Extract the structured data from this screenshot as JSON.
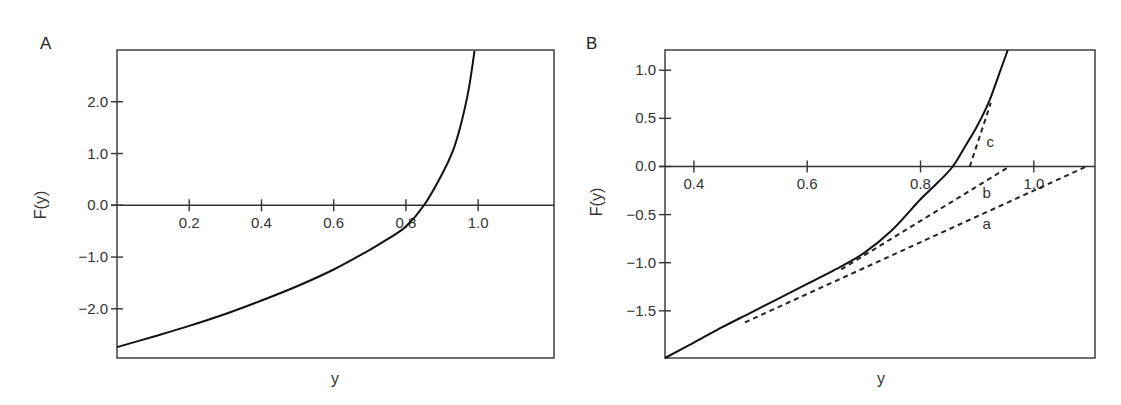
{
  "chart_data": [
    {
      "panel": "A",
      "type": "line",
      "title": "",
      "xlabel": "y",
      "ylabel": "F(y)",
      "xlim": [
        0.0,
        1.21
      ],
      "ylim": [
        -2.95,
        3.0
      ],
      "grid": false,
      "x_ticks": [
        0.2,
        0.4,
        0.6,
        0.8,
        1.0
      ],
      "x_tick_labels": [
        "0.2",
        "0.4",
        "0.6",
        "0.8",
        "1.0"
      ],
      "y_ticks": [
        2.0,
        1.0,
        0.0,
        -1.0,
        -2.0
      ],
      "y_tick_labels": [
        "2.0",
        "1.0",
        "0.0",
        "−1.0",
        "−2.0"
      ],
      "x_axis_at_y": 0.0,
      "series": [
        {
          "name": "F(y)",
          "style": "solid",
          "x": [
            0.0,
            0.1,
            0.2,
            0.3,
            0.4,
            0.5,
            0.6,
            0.7,
            0.75,
            0.8,
            0.85,
            0.9,
            0.93,
            0.95,
            0.97,
            0.98,
            0.99
          ],
          "y": [
            -2.74,
            -2.54,
            -2.33,
            -2.1,
            -1.84,
            -1.56,
            -1.24,
            -0.86,
            -0.65,
            -0.41,
            0.0,
            0.6,
            1.05,
            1.5,
            2.1,
            2.5,
            2.98
          ]
        }
      ]
    },
    {
      "panel": "B",
      "type": "line",
      "title": "",
      "xlabel": "y",
      "ylabel": "F(y)",
      "xlim": [
        0.349,
        1.108
      ],
      "ylim": [
        -1.99,
        1.21
      ],
      "grid": false,
      "x_ticks": [
        0.4,
        0.6,
        0.8,
        1.0
      ],
      "x_tick_labels": [
        "0.4",
        "0.6",
        "0.8",
        "1.0"
      ],
      "y_ticks": [
        1.0,
        0.5,
        0.0,
        -0.5,
        -1.0,
        -1.5
      ],
      "y_tick_labels": [
        "1.0",
        "0.5",
        "0.0",
        "−0.5",
        "−1.0",
        "−1.5"
      ],
      "x_axis_at_y": 0.0,
      "series": [
        {
          "name": "F(y)",
          "style": "solid",
          "x": [
            0.349,
            0.4,
            0.45,
            0.5,
            0.55,
            0.6,
            0.65,
            0.7,
            0.75,
            0.8,
            0.83,
            0.857,
            0.88,
            0.9,
            0.92,
            0.94,
            0.954
          ],
          "y": [
            -1.99,
            -1.83,
            -1.67,
            -1.52,
            -1.37,
            -1.22,
            -1.07,
            -0.9,
            -0.66,
            -0.34,
            -0.17,
            0.0,
            0.22,
            0.42,
            0.66,
            0.98,
            1.21
          ]
        },
        {
          "name": "a",
          "style": "dashed",
          "label_pos": {
            "x": 0.917,
            "y": -0.6
          },
          "x": [
            0.49,
            1.093
          ],
          "y": [
            -1.62,
            0.0
          ]
        },
        {
          "name": "b",
          "style": "dashed",
          "label_pos": {
            "x": 0.917,
            "y": -0.28
          },
          "x": [
            0.66,
            0.957
          ],
          "y": [
            -1.07,
            0.0
          ]
        },
        {
          "name": "c",
          "style": "dashed",
          "label_pos": {
            "x": 0.923,
            "y": 0.25
          },
          "x": [
            0.887,
            0.924
          ],
          "y": [
            0.0,
            0.66
          ]
        }
      ]
    }
  ],
  "panels": {
    "A": {
      "label": "A",
      "xlabel": "y",
      "ylabel": "F(y)"
    },
    "B": {
      "label": "B",
      "xlabel": "y",
      "ylabel": "F(y)"
    }
  }
}
